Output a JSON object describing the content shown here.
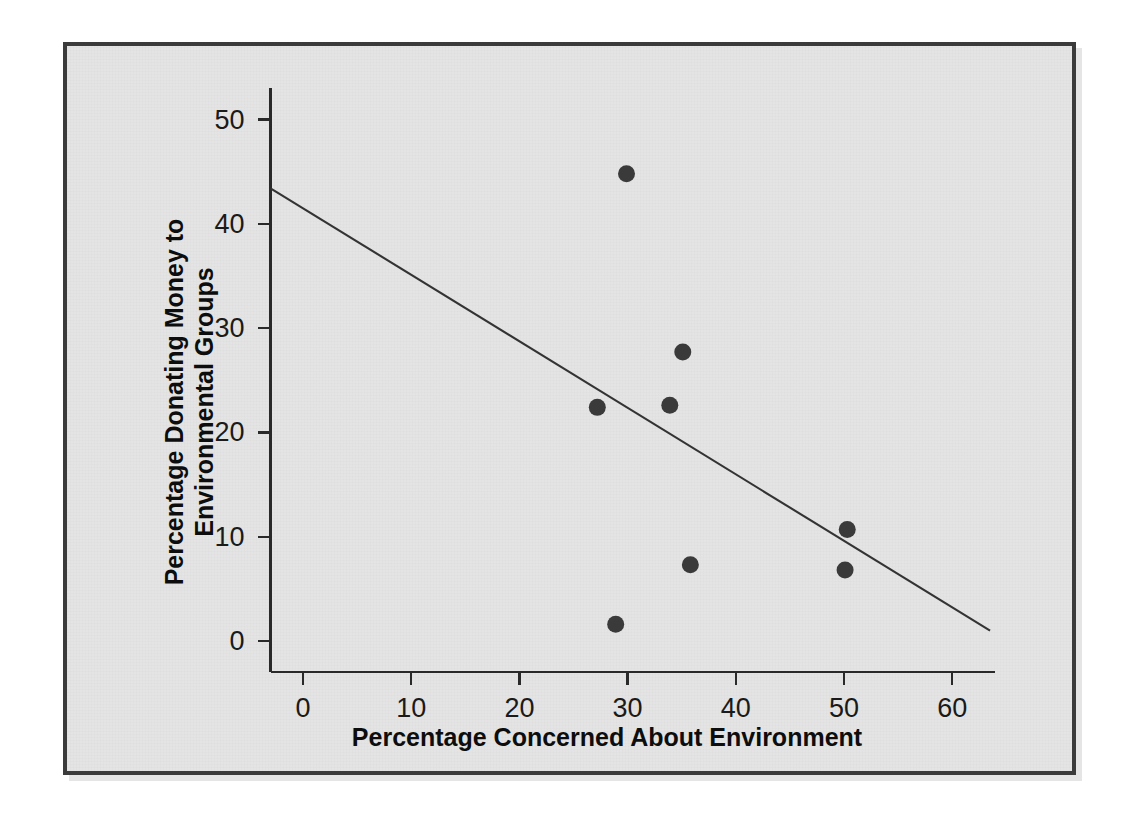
{
  "figure": {
    "background_color": "#e4e4e4",
    "frame_color": "#3b3b3b",
    "point_color": "#3a3a3a",
    "line_color": "#333333"
  },
  "chart_data": {
    "type": "scatter",
    "title": "",
    "xlabel": "Percentage Concerned About Environment",
    "ylabel": "Percentage Donating Money to Environmental Groups",
    "xlim": [
      -3,
      64
    ],
    "ylim": [
      -3,
      53
    ],
    "xticks": [
      0,
      10,
      20,
      30,
      40,
      50,
      60
    ],
    "yticks": [
      0,
      10,
      20,
      30,
      40,
      50
    ],
    "xtick_labels": [
      "0",
      "10",
      "20",
      "30",
      "40",
      "50",
      "60"
    ],
    "ytick_labels": [
      "0",
      "10",
      "20",
      "30",
      "40",
      "50"
    ],
    "grid": false,
    "legend": false,
    "points": [
      {
        "x": 29.9,
        "y": 44.8
      },
      {
        "x": 35.1,
        "y": 27.7
      },
      {
        "x": 33.9,
        "y": 22.6
      },
      {
        "x": 27.2,
        "y": 22.4
      },
      {
        "x": 50.3,
        "y": 10.7
      },
      {
        "x": 35.8,
        "y": 7.3
      },
      {
        "x": 50.1,
        "y": 6.8
      },
      {
        "x": 28.9,
        "y": 1.6
      }
    ],
    "trend_line": {
      "type": "linear-fit",
      "x_start": -3.0,
      "y_start": 43.4,
      "x_end": 63.5,
      "y_end": 1.0
    }
  },
  "axis_titles": {
    "x": "Percentage Concerned About Environment",
    "y_line_1": "Percentage Donating Money to",
    "y_line_2": "Environmental Groups"
  }
}
